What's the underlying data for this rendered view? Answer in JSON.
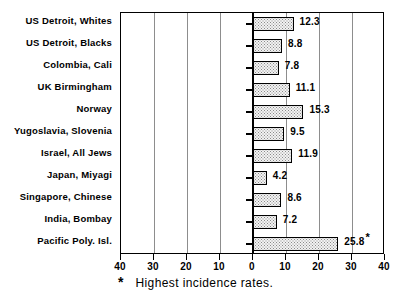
{
  "chart_data": {
    "type": "bar",
    "orientation": "horizontal",
    "title": "",
    "subtitle": "",
    "xlabel": "",
    "ylabel": "",
    "xlim": [
      -40,
      40
    ],
    "xticks": [
      -40,
      -30,
      -20,
      -10,
      0,
      10,
      20,
      30,
      40
    ],
    "xtick_labels": [
      "40",
      "30",
      "20",
      "10",
      "0",
      "10",
      "20",
      "30",
      "40"
    ],
    "grid": true,
    "grid_axis": "x",
    "legend": "none",
    "categories": [
      "US Detroit, Whites",
      "US Detroit, Blacks",
      "Colombia, Cali",
      "UK Birmingham",
      "Norway",
      "Yugoslavia, Slovenia",
      "Israel, All Jews",
      "Japan, Miyagi",
      "Singapore, Chinese",
      "India, Bombay",
      "Pacific Poly. Isl."
    ],
    "values": [
      12.3,
      8.8,
      7.8,
      11.1,
      15.3,
      9.5,
      11.9,
      4.2,
      8.6,
      7.2,
      25.8
    ],
    "value_labels": [
      "12.3",
      "8.8",
      "7.8",
      "11.1",
      "15.3",
      "9.5",
      "11.9",
      "4.2",
      "8.6",
      "7.2",
      "25.8"
    ],
    "annotations": [
      {
        "category": "Pacific Poly. Isl.",
        "marker": "*",
        "meaning": "Highest incidence rates."
      }
    ],
    "bar_fill": "stippled-dot",
    "bar_edge_color": "#000000",
    "bar_fill_color": "#f2f2f2",
    "axis_color": "#000000",
    "gridline_color": "#8d8d8d"
  },
  "footnote": {
    "marker": "*",
    "text": "Highest incidence rates."
  },
  "series_points": [
    {
      "label": "US Detroit, Whites",
      "value": 12.3,
      "display": "12.3",
      "starred": false
    },
    {
      "label": "US Detroit, Blacks",
      "value": 8.8,
      "display": "8.8",
      "starred": false
    },
    {
      "label": "Colombia, Cali",
      "value": 7.8,
      "display": "7.8",
      "starred": false
    },
    {
      "label": "UK Birmingham",
      "value": 11.1,
      "display": "11.1",
      "starred": false
    },
    {
      "label": "Norway",
      "value": 15.3,
      "display": "15.3",
      "starred": false
    },
    {
      "label": "Yugoslavia, Slovenia",
      "value": 9.5,
      "display": "9.5",
      "starred": false
    },
    {
      "label": "Israel, All Jews",
      "value": 11.9,
      "display": "11.9",
      "starred": false
    },
    {
      "label": "Japan, Miyagi",
      "value": 4.2,
      "display": "4.2",
      "starred": false
    },
    {
      "label": "Singapore, Chinese",
      "value": 8.6,
      "display": "8.6",
      "starred": false
    },
    {
      "label": "India, Bombay",
      "value": 7.2,
      "display": "7.2",
      "starred": false
    },
    {
      "label": "Pacific Poly. Isl.",
      "value": 25.8,
      "display": "25.8",
      "starred": true
    }
  ]
}
